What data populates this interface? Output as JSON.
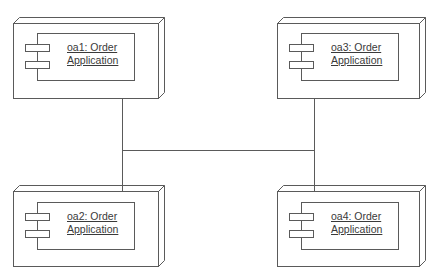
{
  "diagram": {
    "type": "UML deployment diagram",
    "line_color": "#5a5a5a",
    "background": "#ffffff",
    "nodes": [
      {
        "id": "oa1",
        "line1": "oa1: Order",
        "line2": "Application",
        "position": "top-left"
      },
      {
        "id": "oa3",
        "line1": "oa3: Order",
        "line2": "Application",
        "position": "top-right"
      },
      {
        "id": "oa2",
        "line1": "oa2: Order",
        "line2": "Application",
        "position": "bottom-left"
      },
      {
        "id": "oa4",
        "line1": "oa4: Order",
        "line2": "Application",
        "position": "bottom-right"
      }
    ],
    "connections": [
      {
        "from": "oa1",
        "to": "oa2"
      },
      {
        "from": "oa3",
        "to": "oa4"
      },
      {
        "from": "left-bus",
        "to": "right-bus"
      }
    ]
  }
}
